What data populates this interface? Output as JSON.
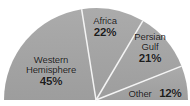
{
  "chart_data": {
    "type": "pie",
    "title": "",
    "subtitle": "",
    "xlabel": "",
    "ylabel": "",
    "variant": "half-pie",
    "start_angle_deg": 180,
    "sweep_deg": 180,
    "direction": "clockwise",
    "legend": "none",
    "grid": false,
    "categories": [
      "Western Hemisphere",
      "Africa",
      "Persian Gulf",
      "Other"
    ],
    "values": [
      45,
      22,
      21,
      12
    ],
    "units": "%",
    "total": 100,
    "slices": [
      {
        "label": "Western Hemisphere",
        "label_line1": "Western",
        "label_line2": "Hemisphere",
        "value": 45,
        "value_text": "45%",
        "color": "#a0a0a0",
        "start_deg": 180,
        "end_deg": 261
      },
      {
        "label": "Africa",
        "label_line1": "Africa",
        "label_line2": "",
        "value": 22,
        "value_text": "22%",
        "color": "#a8a8a8",
        "start_deg": 261,
        "end_deg": 300.6
      },
      {
        "label": "Persian Gulf",
        "label_line1": "Persian",
        "label_line2": "Gulf",
        "value": 21,
        "value_text": "21%",
        "color": "#a3a3a3",
        "start_deg": 300.6,
        "end_deg": 338.4
      },
      {
        "label": "Other",
        "label_line1": "Other",
        "label_line2": "",
        "value": 12,
        "value_text": "12%",
        "color": "#aaaaaa",
        "start_deg": 338.4,
        "end_deg": 360
      }
    ],
    "colors": {
      "background": "#ffffff",
      "slice_fill": "#a4a4a4",
      "separator": "#f2f2f2",
      "text": "#1c1c1c"
    },
    "geometry": {
      "center_x": 96,
      "center_y": 100,
      "radius": 92
    }
  }
}
